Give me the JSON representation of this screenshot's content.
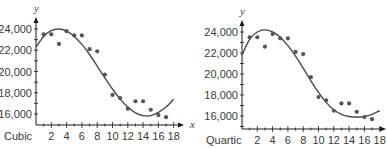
{
  "chart_data": [
    {
      "type": "scatter",
      "title": "",
      "model_label": "Cubic",
      "xlabel": "x",
      "ylabel": "y",
      "xlim": [
        0,
        18
      ],
      "ylim": [
        15000,
        24800
      ],
      "x_ticks": [
        2,
        4,
        6,
        8,
        10,
        12,
        14,
        16,
        18
      ],
      "y_ticks": [
        16000,
        18000,
        20000,
        22000,
        24000
      ],
      "y_tick_labels": [
        "16,000",
        "18,000",
        "20,000",
        "22,000",
        "24,000"
      ],
      "grid": false,
      "series": [
        {
          "name": "data points",
          "x": [
            1,
            2,
            3,
            4,
            5,
            6,
            7,
            8,
            9,
            10,
            11,
            12,
            13,
            14,
            15,
            16,
            17
          ],
          "y": [
            23500,
            23500,
            22600,
            23800,
            23400,
            23400,
            22100,
            21900,
            19700,
            17800,
            17500,
            16500,
            17200,
            17200,
            16400,
            15900,
            15700
          ]
        },
        {
          "name": "cubic fit",
          "x": [
            0,
            1,
            2,
            3,
            4,
            5,
            6,
            7,
            8,
            9,
            10,
            11,
            12,
            13,
            14,
            15,
            16,
            17,
            18
          ],
          "y": [
            22300,
            23300,
            23850,
            24000,
            23800,
            23300,
            22550,
            21600,
            20500,
            19400,
            18350,
            17400,
            16650,
            16100,
            15850,
            15850,
            16150,
            16650,
            17400
          ]
        }
      ]
    },
    {
      "type": "scatter",
      "title": "",
      "model_label": "Quartic",
      "xlabel": "x",
      "ylabel": "y",
      "xlim": [
        0,
        18
      ],
      "ylim": [
        15000,
        24800
      ],
      "x_ticks": [
        2,
        4,
        6,
        8,
        10,
        12,
        14,
        16,
        18
      ],
      "y_ticks": [
        16000,
        18000,
        20000,
        22000,
        24000
      ],
      "y_tick_labels": [
        "16,000",
        "18,000",
        "20,000",
        "22,000",
        "24,000"
      ],
      "grid": false,
      "series": [
        {
          "name": "data points",
          "x": [
            1,
            2,
            3,
            4,
            5,
            6,
            7,
            8,
            9,
            10,
            11,
            12,
            13,
            14,
            15,
            16,
            17
          ],
          "y": [
            23500,
            23500,
            22600,
            23800,
            23400,
            23400,
            22100,
            21900,
            19700,
            17800,
            17500,
            16500,
            17200,
            17200,
            16400,
            15900,
            15700
          ]
        },
        {
          "name": "quartic fit",
          "x": [
            0,
            1,
            2,
            3,
            4,
            5,
            6,
            7,
            8,
            9,
            10,
            11,
            12,
            13,
            14,
            15,
            16,
            17,
            18
          ],
          "y": [
            21800,
            23300,
            24000,
            24200,
            24000,
            23500,
            22700,
            21700,
            20550,
            19350,
            18250,
            17300,
            16600,
            16150,
            15950,
            15900,
            15950,
            16150,
            16500
          ]
        }
      ]
    }
  ],
  "colors": {
    "axis": "#1a1a1a",
    "curve": "#4a4a4a",
    "points": "#555555",
    "text": "#3a3a3a"
  },
  "layout_panels": [
    {
      "x0": 36,
      "xPerUnit": 7.65,
      "yAxisBase": 125,
      "y24000": 29,
      "y16000": 114,
      "arrowTop": 17,
      "xArrowEnd": 184,
      "xLabelX": 190,
      "modelLabelX": 4
    },
    {
      "x0": 242,
      "xPerUnit": 7.65,
      "yAxisBase": 129,
      "y24000": 32,
      "y16000": 116,
      "arrowTop": 20,
      "xArrowEnd": 386,
      "xLabelX": null,
      "modelLabelX": 206
    }
  ]
}
